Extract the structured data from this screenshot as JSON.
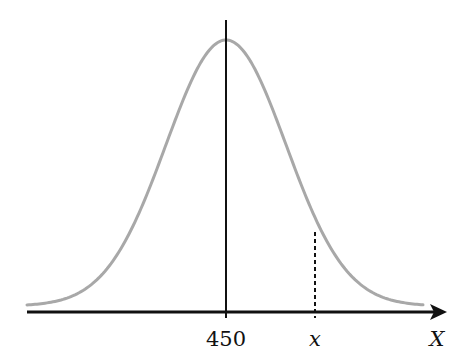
{
  "diagram": {
    "type": "normal-distribution-curve",
    "mean_label": "450",
    "x_marker_label": "x",
    "axis_label": "X",
    "colors": {
      "curve": "#a8a8a8",
      "axis": "#111111",
      "background": "#ffffff"
    }
  },
  "chart_data": {
    "type": "line",
    "title": "",
    "xlabel": "X",
    "ylabel": "",
    "tick_labels": [
      "450",
      "x"
    ],
    "series": [
      {
        "name": "normal density",
        "mean": 450,
        "shape": "bell curve"
      }
    ],
    "annotations": [
      {
        "type": "vertical-solid-line",
        "at": "450",
        "note": "line of symmetry at mean"
      },
      {
        "type": "vertical-dashed-line",
        "at": "x",
        "note": "from axis up to curve, right of mean"
      }
    ],
    "grid": false,
    "legend": false
  }
}
